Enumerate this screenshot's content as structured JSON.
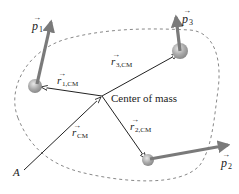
{
  "diagram": {
    "labels": {
      "center_of_mass": "Center of mass",
      "origin": "A",
      "r_cm": "r",
      "r_cm_sub": "CM",
      "r1_cm": "r",
      "r1_cm_sub": "1,CM",
      "r2_cm": "r",
      "r2_cm_sub": "2,CM",
      "r3_cm": "r",
      "r3_cm_sub": "3,CM",
      "p1": "p",
      "p1_sub": "1",
      "p2": "p",
      "p2_sub": "2",
      "p3": "p",
      "p3_sub": "3"
    },
    "colors": {
      "vector_thin": "#222222",
      "momentum_arrow": "#7a7a7a",
      "particle": "#a8a8a8",
      "boundary": "#888888"
    }
  }
}
